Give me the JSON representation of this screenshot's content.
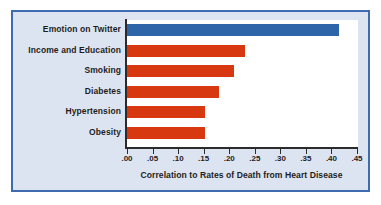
{
  "chart_data": {
    "type": "bar",
    "orientation": "horizontal",
    "title": "",
    "subtitle": "",
    "xlabel": "Correlation to Rates of Death from Heart Disease",
    "ylabel": "",
    "categories": [
      "Emotion on Twitter",
      "Income and Education",
      "Smoking",
      "Diabetes",
      "Hypertension",
      "Obesity"
    ],
    "values": [
      0.415,
      0.23,
      0.21,
      0.18,
      0.152,
      0.152
    ],
    "bar_colors": [
      "#2e64a8",
      "#d8380f",
      "#d8380f",
      "#d8380f",
      "#d8380f",
      "#d8380f"
    ],
    "highlight_index": 0,
    "xlim": [
      0.0,
      0.45
    ],
    "xticks": [
      0.0,
      0.05,
      0.1,
      0.15,
      0.2,
      0.25,
      0.3,
      0.35,
      0.4,
      0.45
    ],
    "xticklabels": [
      ".00",
      ".05",
      ".10",
      ".15",
      ".20",
      ".25",
      ".30",
      ".35",
      ".40",
      ".45"
    ],
    "grid": false,
    "legend": false,
    "legend_position": "none"
  },
  "style": {
    "frame_border_color": "#3f6cb0",
    "frame_background": "#dde4f1",
    "plot_background": "#ffffff",
    "axis_line_color": "#2b2b2b",
    "accent_color": "#2e64a8",
    "bar_color": "#d8380f",
    "text_color": "#1d1d1d"
  }
}
